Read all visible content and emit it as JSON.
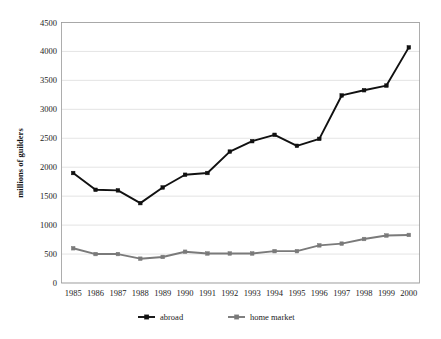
{
  "chart_data": {
    "type": "line",
    "title": "",
    "xlabel": "",
    "ylabel": "millions of guilders",
    "categories": [
      "1985",
      "1986",
      "1987",
      "1988",
      "1989",
      "1990",
      "1991",
      "1992",
      "1993",
      "1994",
      "1995",
      "1996",
      "1997",
      "1998",
      "1999",
      "2000"
    ],
    "ylim": [
      0,
      4500
    ],
    "ytick_step": 500,
    "yticks": [
      "0",
      "500",
      "1000",
      "1500",
      "2000",
      "2500",
      "3000",
      "3500",
      "4000",
      "4500"
    ],
    "grid": true,
    "legend_position": "bottom",
    "series": [
      {
        "name": "abroad",
        "color": "#111111",
        "marker": "square",
        "values": [
          1900,
          1610,
          1600,
          1380,
          1650,
          1870,
          1900,
          2270,
          2450,
          2560,
          2370,
          2490,
          3240,
          3330,
          3410,
          4070
        ]
      },
      {
        "name": "home market",
        "color": "#7a7a7a",
        "marker": "square",
        "values": [
          600,
          500,
          500,
          420,
          450,
          540,
          510,
          510,
          510,
          550,
          550,
          650,
          680,
          760,
          820,
          830
        ]
      }
    ]
  },
  "legend": {
    "items": [
      {
        "label": "abroad",
        "color": "#111111"
      },
      {
        "label": "home market",
        "color": "#7a7a7a"
      }
    ]
  },
  "axes": {
    "y_title": "millions of guilders"
  }
}
